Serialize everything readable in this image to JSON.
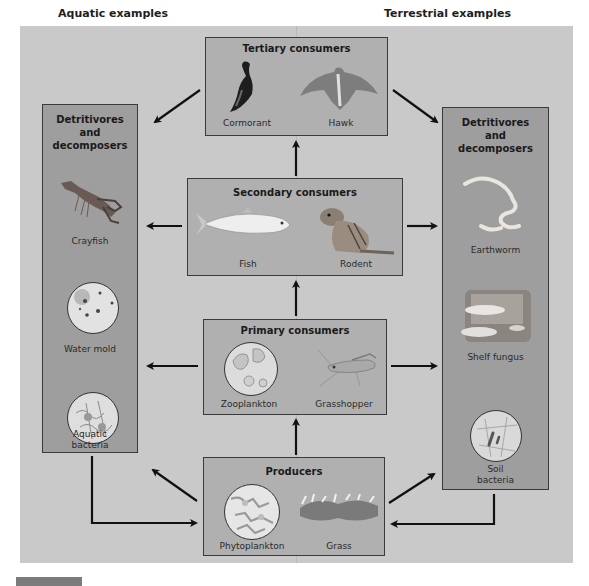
{
  "headers": {
    "aquatic": "Aquatic examples",
    "terrestrial": "Terrestrial examples"
  },
  "levels": {
    "tertiary": {
      "title": "Tertiary consumers",
      "organisms": [
        {
          "label": "Cormorant",
          "icon": "cormorant-bird-icon"
        },
        {
          "label": "Hawk",
          "icon": "hawk-bird-icon"
        }
      ]
    },
    "secondary": {
      "title": "Secondary consumers",
      "organisms": [
        {
          "label": "Fish",
          "icon": "fish-icon"
        },
        {
          "label": "Rodent",
          "icon": "rodent-icon"
        }
      ]
    },
    "primary": {
      "title": "Primary consumers",
      "organisms": [
        {
          "label": "Zooplankton",
          "icon": "zooplankton-micrograph-icon"
        },
        {
          "label": "Grasshopper",
          "icon": "grasshopper-icon"
        }
      ]
    },
    "producers": {
      "title": "Producers",
      "organisms": [
        {
          "label": "Phytoplankton",
          "icon": "phytoplankton-micrograph-icon"
        },
        {
          "label": "Grass",
          "icon": "grass-icon"
        }
      ]
    }
  },
  "detritivores_aquatic": {
    "title_line1": "Detritivores",
    "title_line2": "and",
    "title_line3": "decomposers",
    "organisms": [
      {
        "label": "Crayfish",
        "icon": "crayfish-icon"
      },
      {
        "label": "Water mold",
        "icon": "water-mold-micrograph-icon"
      },
      {
        "label_line1": "Aquatic",
        "label_line2": "bacteria",
        "icon": "bacteria-micrograph-icon"
      }
    ]
  },
  "detritivores_terrestrial": {
    "title_line1": "Detritivores",
    "title_line2": "and",
    "title_line3": "decomposers",
    "organisms": [
      {
        "label": "Earthworm",
        "icon": "earthworm-icon"
      },
      {
        "label": "Shelf fungus",
        "icon": "shelf-fungus-icon"
      },
      {
        "label_line1": "Soil",
        "label_line2": "bacteria",
        "icon": "bacteria-micrograph-icon"
      }
    ]
  },
  "caption": {
    "tag": "",
    "text": ""
  },
  "colors": {
    "panel": "#c9c9c9",
    "level_box": "#b0b0b0",
    "detritivore_column": "#9e9e9e",
    "arrow": "#111111"
  }
}
